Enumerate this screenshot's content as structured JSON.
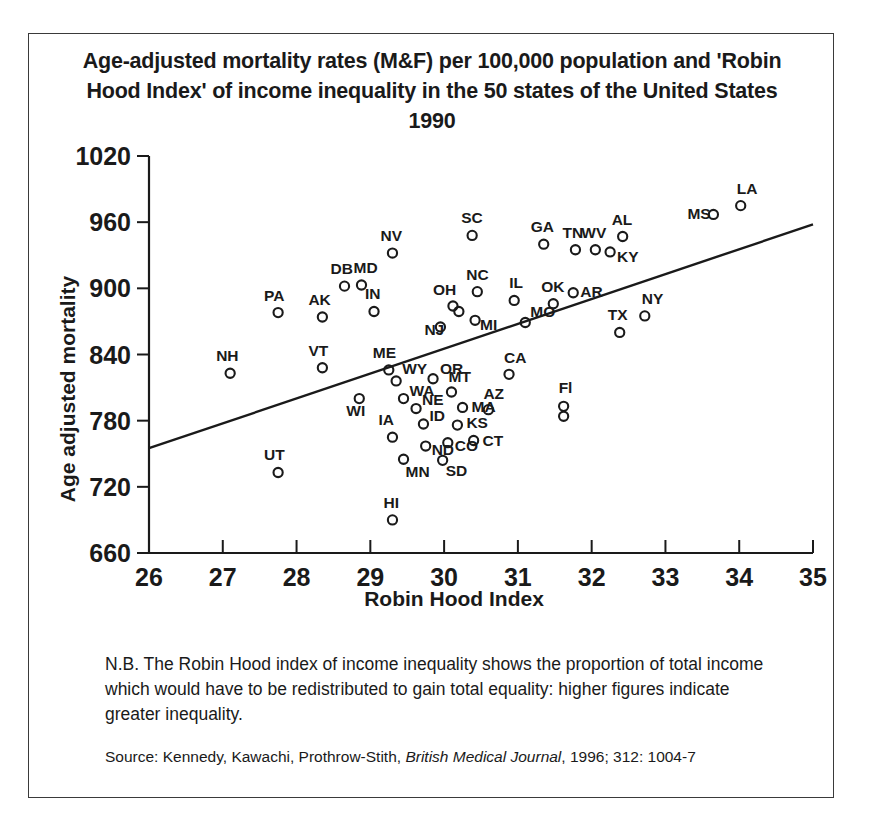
{
  "figure": {
    "title": "Age-adjusted mortality rates (M&F) per 100,000 population and 'Robin Hood Index' of income inequality in the 50 states of the United States 1990",
    "note": "N.B. The Robin Hood index of income inequality shows the proportion of total income which would have to be redistributed to gain total equality: higher figures indicate greater inequality.",
    "source_prefix": "Source: Kennedy, Kawachi, Prothrow-Stith, ",
    "source_italic": "British Medical Journal",
    "source_suffix": ", 1996; 312: 1004-7"
  },
  "chart_data": {
    "type": "scatter",
    "title": "Age-adjusted mortality rates (M&F) per 100,000 population and 'Robin Hood Index' of income inequality in the 50 states of the United States 1990",
    "xlabel": "Robin Hood Index",
    "ylabel": "Age adjusted mortality",
    "xlim": [
      26,
      35
    ],
    "ylim": [
      660,
      1020
    ],
    "xticks": [
      26,
      27,
      28,
      29,
      30,
      31,
      32,
      33,
      34,
      35
    ],
    "yticks": [
      660,
      720,
      780,
      840,
      900,
      960,
      1020
    ],
    "grid": false,
    "legend": false,
    "marker": "open-circle",
    "trendline": {
      "x": [
        26,
        35
      ],
      "y": [
        755,
        958
      ]
    },
    "points": [
      {
        "label": "NH",
        "x": 27.1,
        "y": 823,
        "label_dx": -14,
        "label_dy": -12
      },
      {
        "label": "PA",
        "x": 27.75,
        "y": 878,
        "label_dx": -14,
        "label_dy": -12
      },
      {
        "label": "AK",
        "x": 28.35,
        "y": 874,
        "label_dx": -14,
        "label_dy": -12
      },
      {
        "label": "VT",
        "x": 28.35,
        "y": 828,
        "label_dx": -14,
        "label_dy": -12
      },
      {
        "label": "WI",
        "x": 28.85,
        "y": 800,
        "label_dx": -13,
        "label_dy": 17
      },
      {
        "label": "UT",
        "x": 27.75,
        "y": 733,
        "label_dx": -14,
        "label_dy": -12
      },
      {
        "label": "DB",
        "x": 28.65,
        "y": 902,
        "label_dx": -14,
        "label_dy": -12
      },
      {
        "label": "MD",
        "x": 28.88,
        "y": 903,
        "label_dx": -8,
        "label_dy": -12
      },
      {
        "label": "IN",
        "x": 29.05,
        "y": 879,
        "label_dx": -9,
        "label_dy": -12
      },
      {
        "label": "NV",
        "x": 29.3,
        "y": 932,
        "label_dx": -12,
        "label_dy": -12
      },
      {
        "label": "ME",
        "x": 29.25,
        "y": 826,
        "label_dx": -16,
        "label_dy": -12
      },
      {
        "label": "WY",
        "x": 29.35,
        "y": 816,
        "label_dx": 6,
        "label_dy": -7
      },
      {
        "label": "WA",
        "x": 29.45,
        "y": 800,
        "label_dx": 6,
        "label_dy": -3
      },
      {
        "label": "NE",
        "x": 29.62,
        "y": 791,
        "label_dx": 6,
        "label_dy": -4
      },
      {
        "label": "ID",
        "x": 29.72,
        "y": 777,
        "label_dx": 6,
        "label_dy": -3
      },
      {
        "label": "IA",
        "x": 29.3,
        "y": 765,
        "label_dx": -14,
        "label_dy": -12
      },
      {
        "label": "MN",
        "x": 29.45,
        "y": 745,
        "label_dx": 2,
        "label_dy": 18
      },
      {
        "label": "ND",
        "x": 29.75,
        "y": 757,
        "label_dx": 6,
        "label_dy": 9
      },
      {
        "label": "SD",
        "x": 29.98,
        "y": 744,
        "label_dx": 3,
        "label_dy": 16
      },
      {
        "label": "HI",
        "x": 29.3,
        "y": 690,
        "label_dx": -9,
        "label_dy": -12
      },
      {
        "label": "OR",
        "x": 29.85,
        "y": 818,
        "label_dx": 7,
        "label_dy": -5
      },
      {
        "label": "NJ",
        "x": 29.95,
        "y": 865,
        "label_dx": -16,
        "label_dy": 8
      },
      {
        "label": "OH",
        "x": 30.12,
        "y": 884,
        "label_dx": -20,
        "label_dy": -11
      },
      {
        "label": "OH2",
        "x": 30.2,
        "y": 879,
        "label_dx": 0,
        "label_dy": 0,
        "hide_label": true
      },
      {
        "label": "MI",
        "x": 30.42,
        "y": 871,
        "label_dx": 5,
        "label_dy": 10
      },
      {
        "label": "NC",
        "x": 30.45,
        "y": 897,
        "label_dx": -11,
        "label_dy": -12
      },
      {
        "label": "MT",
        "x": 30.1,
        "y": 806,
        "label_dx": -3,
        "label_dy": -10
      },
      {
        "label": "MA",
        "x": 30.25,
        "y": 792,
        "label_dx": 9,
        "label_dy": 5
      },
      {
        "label": "KS",
        "x": 30.18,
        "y": 776,
        "label_dx": 9,
        "label_dy": 3
      },
      {
        "label": "CO",
        "x": 30.05,
        "y": 760,
        "label_dx": 7,
        "label_dy": 8
      },
      {
        "label": "CT",
        "x": 30.4,
        "y": 762,
        "label_dx": 9,
        "label_dy": 5
      },
      {
        "label": "SC",
        "x": 30.38,
        "y": 948,
        "label_dx": -11,
        "label_dy": -12
      },
      {
        "label": "IL",
        "x": 30.95,
        "y": 889,
        "label_dx": -5,
        "label_dy": -12
      },
      {
        "label": "MO",
        "x": 31.1,
        "y": 869,
        "label_dx": 5,
        "label_dy": -6
      },
      {
        "label": "CA",
        "x": 30.88,
        "y": 822,
        "label_dx": -5,
        "label_dy": -11
      },
      {
        "label": "AZ",
        "x": 30.6,
        "y": 790,
        "label_dx": -5,
        "label_dy": -11
      },
      {
        "label": "Fl",
        "x": 31.62,
        "y": 793,
        "label_dx": -5,
        "label_dy": -13
      },
      {
        "label": "Fl2",
        "x": 31.62,
        "y": 784,
        "label_dx": 0,
        "label_dy": 0,
        "hide_label": true
      },
      {
        "label": "GA",
        "x": 31.35,
        "y": 940,
        "label_dx": -13,
        "label_dy": -12
      },
      {
        "label": "OK",
        "x": 31.48,
        "y": 886,
        "label_dx": -12,
        "label_dy": -12
      },
      {
        "label": "AR",
        "x": 31.75,
        "y": 896,
        "label_dx": 7,
        "label_dy": 4
      },
      {
        "label": "TN",
        "x": 31.78,
        "y": 935,
        "label_dx": -13,
        "label_dy": -12
      },
      {
        "label": "WV",
        "x": 32.05,
        "y": 935,
        "label_dx": -14,
        "label_dy": -12
      },
      {
        "label": "KY",
        "x": 32.25,
        "y": 933,
        "label_dx": 7,
        "label_dy": 10
      },
      {
        "label": "AL",
        "x": 32.42,
        "y": 947,
        "label_dx": -11,
        "label_dy": -12
      },
      {
        "label": "TX",
        "x": 32.38,
        "y": 860,
        "label_dx": -12,
        "label_dy": -12
      },
      {
        "label": "NY",
        "x": 32.72,
        "y": 875,
        "label_dx": -3,
        "label_dy": -12
      },
      {
        "label": "MS",
        "x": 33.65,
        "y": 967,
        "label_dx": -26,
        "label_dy": 5
      },
      {
        "label": "LA",
        "x": 34.02,
        "y": 975,
        "label_dx": -4,
        "label_dy": -12
      }
    ]
  }
}
